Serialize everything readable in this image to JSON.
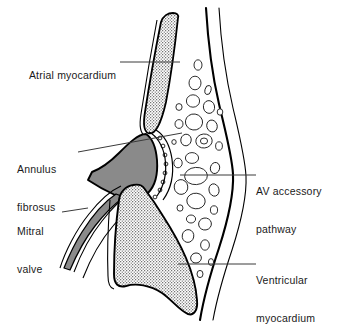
{
  "figure": {
    "background_color": "#ffffff",
    "line_color": "#000000",
    "leader_line_color": "#3a3a3a",
    "annulus_fill_color": "#8a8a8a",
    "myocardium_stipple_color": "#4a4a4a",
    "fat_cell_outline_color": "#1a1a1a"
  },
  "labels": {
    "atrial_myocardium": {
      "line1": "Atrial myocardium",
      "line2": "",
      "side": "left",
      "name": "atrial-myocardium"
    },
    "annulus_fibrosus": {
      "line1": "Annulus",
      "line2": "fibrosus",
      "side": "left",
      "name": "annulus-fibrosus"
    },
    "mitral_valve": {
      "line1": "Mitral",
      "line2": "valve",
      "side": "left",
      "name": "mitral-valve"
    },
    "av_accessory_pathway": {
      "line1": "AV accessory",
      "line2": "pathway",
      "side": "right",
      "name": "av-accessory-pathway"
    },
    "ventricular_myocardium": {
      "line1": "Ventricular",
      "line2": "myocardium",
      "side": "right",
      "name": "ventricular-myocardium"
    }
  },
  "structures": [
    {
      "id": "atrial-myocardium",
      "fill": "stipple",
      "description": "Atrial myocardium, upper stippled band"
    },
    {
      "id": "annulus-fibrosus",
      "fill": "solid-gray",
      "description": "Annulus fibrosus, solid gray teardrop"
    },
    {
      "id": "mitral-valve",
      "fill": "solid-gray",
      "description": "Mitral valve leaflet, gray strip descending left"
    },
    {
      "id": "ventricular-myocardium",
      "fill": "stipple",
      "description": "Ventricular myocardium, lower stippled mass"
    },
    {
      "id": "av-groove-fat",
      "fill": "cells",
      "description": "AV groove adipose tissue with rounded fat cells"
    },
    {
      "id": "epicardium",
      "fill": "none",
      "description": "Outer epicardial surface line"
    }
  ]
}
